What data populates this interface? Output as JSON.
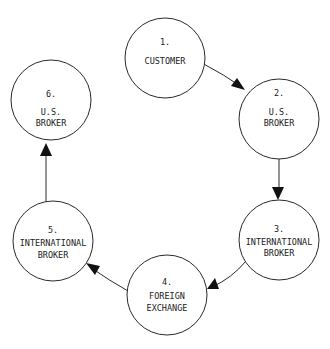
{
  "diagram": {
    "type": "cycle",
    "nodes": [
      {
        "id": 1,
        "number": "1.",
        "line1": "CUSTOMER",
        "line2": ""
      },
      {
        "id": 2,
        "number": "2.",
        "line1": "U.S.",
        "line2": "BROKER"
      },
      {
        "id": 3,
        "number": "3.",
        "line1": "INTERNATIONAL",
        "line2": "BROKER"
      },
      {
        "id": 4,
        "number": "4.",
        "line1": "FOREIGN",
        "line2": "EXCHANGE"
      },
      {
        "id": 5,
        "number": "5.",
        "line1": "INTERNATIONAL",
        "line2": "BROKER"
      },
      {
        "id": 6,
        "number": "6.",
        "line1": "U.S.",
        "line2": "BROKER"
      }
    ],
    "edges": [
      {
        "from": 1,
        "to": 2
      },
      {
        "from": 2,
        "to": 3
      },
      {
        "from": 3,
        "to": 4
      },
      {
        "from": 4,
        "to": 5
      },
      {
        "from": 5,
        "to": 6
      }
    ]
  }
}
